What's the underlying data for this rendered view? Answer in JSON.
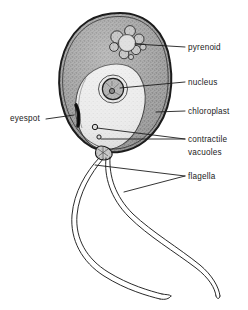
{
  "figure": {
    "style": "grayscale stipple line drawing",
    "background_color": "#ffffff",
    "ink_color": "#1c1c1c"
  },
  "labels": [
    {
      "id": "pyrenoid",
      "text": "pyrenoid",
      "x": 188,
      "y": 50
    },
    {
      "id": "nucleus",
      "text": "nucleus",
      "x": 188,
      "y": 85
    },
    {
      "id": "chloroplast",
      "text": "chloroplast",
      "x": 188,
      "y": 114
    },
    {
      "id": "contractile",
      "text": "contractile",
      "x": 188,
      "y": 142
    },
    {
      "id": "vacuoles",
      "text": "vacuoles",
      "x": 188,
      "y": 155
    },
    {
      "id": "flagella",
      "text": "flagella",
      "x": 188,
      "y": 179
    },
    {
      "id": "eyespot",
      "text": "eyespot",
      "x": 10,
      "y": 121
    }
  ],
  "structures": [
    {
      "id": "cell-wall",
      "name": "cell wall outline",
      "color": "#1c1c1c"
    },
    {
      "id": "chloroplast-body",
      "name": "chloroplast",
      "color": "#9b9b9b"
    },
    {
      "id": "cytoplasm",
      "name": "cytoplasm",
      "color": "#e9e9e9"
    },
    {
      "id": "pyrenoid-body",
      "name": "pyrenoid",
      "color": "#cfcfcf"
    },
    {
      "id": "nucleus-body",
      "name": "nucleus",
      "color": "#b5b5b5"
    },
    {
      "id": "nucleolus",
      "name": "nucleolus",
      "color": "#8a8a8a"
    },
    {
      "id": "eyespot-body",
      "name": "eyespot",
      "color": "#2a2a2a"
    },
    {
      "id": "contractile-vacuole-1",
      "name": "contractile vacuole",
      "color": "#d8d8d8"
    },
    {
      "id": "contractile-vacuole-2",
      "name": "contractile vacuole",
      "color": "#d8d8d8"
    },
    {
      "id": "flagellum-1",
      "name": "flagellum",
      "color": "#1c1c1c"
    },
    {
      "id": "flagellum-2",
      "name": "flagellum",
      "color": "#1c1c1c"
    },
    {
      "id": "papilla",
      "name": "papilla",
      "color": "#7d7d7d"
    }
  ]
}
